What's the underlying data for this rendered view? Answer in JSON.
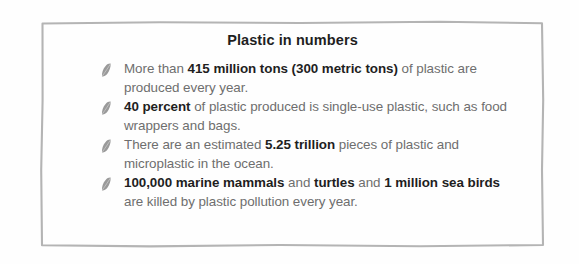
{
  "card": {
    "title": "Plastic in numbers",
    "border_color": "#b4b4b4",
    "background_color": "#fefefe",
    "body_text_color": "#6e6e6e",
    "emphasis_text_color": "#1f1f1f",
    "bullet_icon": "leaf-icon",
    "bullet_color": "#9a9a9a"
  },
  "facts": [
    {
      "id": "fact-production",
      "segments": [
        {
          "text": "More than ",
          "bold": false
        },
        {
          "text": "415 million tons (300 metric tons)",
          "bold": true
        },
        {
          "text": " of plastic are produced every year.",
          "bold": false
        }
      ],
      "plain": "More than 415 million tons (300 metric tons) of plastic are produced every year."
    },
    {
      "id": "fact-single-use",
      "segments": [
        {
          "text": "40 percent",
          "bold": true
        },
        {
          "text": " of plastic produced is single-use plastic, such as food wrappers and bags.",
          "bold": false
        }
      ],
      "plain": "40 percent of plastic produced is single-use plastic, such as food wrappers and bags."
    },
    {
      "id": "fact-ocean-pieces",
      "segments": [
        {
          "text": "There are an estimated ",
          "bold": false
        },
        {
          "text": "5.25 trillion",
          "bold": true
        },
        {
          "text": " pieces of plastic and microplastic in the ocean.",
          "bold": false
        }
      ],
      "plain": "There are an estimated 5.25 trillion pieces of plastic and microplastic in the ocean."
    },
    {
      "id": "fact-wildlife-deaths",
      "segments": [
        {
          "text": "100,000 marine mammals",
          "bold": true
        },
        {
          "text": " and ",
          "bold": false
        },
        {
          "text": "turtles",
          "bold": true
        },
        {
          "text": " and ",
          "bold": false
        },
        {
          "text": "1 million sea birds",
          "bold": true
        },
        {
          "text": " are killed by plastic pollution every year.",
          "bold": false
        }
      ],
      "plain": "100,000 marine mammals and turtles and 1 million sea birds are killed by plastic pollution every year."
    }
  ]
}
